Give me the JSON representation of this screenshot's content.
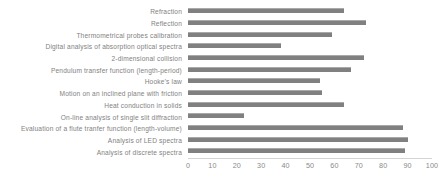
{
  "chart_data": {
    "type": "bar",
    "orientation": "horizontal",
    "title": "",
    "xlabel": "",
    "ylabel": "",
    "xlim": [
      0,
      100
    ],
    "xticks": [
      0,
      10,
      20,
      30,
      40,
      50,
      60,
      70,
      80,
      90,
      100
    ],
    "grid": false,
    "legend": false,
    "bar_color": "#808080",
    "categories": [
      "Refraction",
      "Reflection",
      "Thermometrical  probes calibration",
      "Digital analysis of absorption optical spectra",
      "2-dimensional collision",
      "Pendulum transfer function (length-period)",
      "Hooke's law",
      "Motion on an inclined plane with friction",
      "Heat conduction in solids",
      "On-line analysis of single slit diffraction",
      "Evaluation of a flute tranfer function (length-volume)",
      "Analysis of LED spectra",
      "Analysis of discrete spectra"
    ],
    "values": [
      64,
      73,
      59,
      38,
      72,
      67,
      54,
      55,
      64,
      23,
      88,
      90,
      89
    ]
  }
}
